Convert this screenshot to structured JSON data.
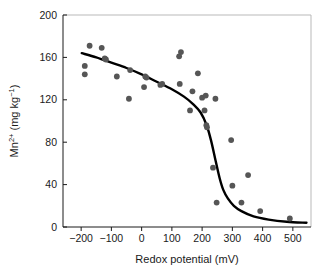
{
  "chart_data": {
    "type": "scatter",
    "title": "",
    "xlabel": "Redox potential (mV)",
    "ylabel_html": "Mn2+ (mg kg-1)",
    "ylabel_base": "Mn",
    "ylabel_sup": "2+",
    "ylabel_units_open": " (mg kg",
    "ylabel_units_sup": "−1",
    "ylabel_units_close": ")",
    "xlim": [
      -260,
      560
    ],
    "ylim": [
      0,
      200
    ],
    "xticks": [
      -200,
      -100,
      0,
      100,
      200,
      300,
      400,
      500
    ],
    "xtick_labels": [
      "−200",
      "−100",
      "0",
      "100",
      "200",
      "300",
      "400",
      "500"
    ],
    "yticks": [
      0,
      40,
      80,
      120,
      160,
      200
    ],
    "ytick_labels": [
      "0",
      "40",
      "80",
      "120",
      "160",
      "200"
    ],
    "grid": false,
    "legend": false,
    "point_color": "#565656",
    "curve_color": "#000000",
    "axis_color": "#1a1a1a",
    "points": [
      {
        "x": -188,
        "y": 152
      },
      {
        "x": -188,
        "y": 144
      },
      {
        "x": -172,
        "y": 171
      },
      {
        "x": -132,
        "y": 169
      },
      {
        "x": -122,
        "y": 159
      },
      {
        "x": -118,
        "y": 158
      },
      {
        "x": -82,
        "y": 142
      },
      {
        "x": -42,
        "y": 121
      },
      {
        "x": -38,
        "y": 148
      },
      {
        "x": 8,
        "y": 132
      },
      {
        "x": 12,
        "y": 142
      },
      {
        "x": 16,
        "y": 141
      },
      {
        "x": 62,
        "y": 134
      },
      {
        "x": 68,
        "y": 135
      },
      {
        "x": 124,
        "y": 161
      },
      {
        "x": 130,
        "y": 165
      },
      {
        "x": 126,
        "y": 135
      },
      {
        "x": 160,
        "y": 110
      },
      {
        "x": 168,
        "y": 128
      },
      {
        "x": 186,
        "y": 145
      },
      {
        "x": 200,
        "y": 122
      },
      {
        "x": 208,
        "y": 110
      },
      {
        "x": 212,
        "y": 124
      },
      {
        "x": 214,
        "y": 96
      },
      {
        "x": 216,
        "y": 94
      },
      {
        "x": 244,
        "y": 121
      },
      {
        "x": 236,
        "y": 56
      },
      {
        "x": 248,
        "y": 23
      },
      {
        "x": 296,
        "y": 82
      },
      {
        "x": 300,
        "y": 39
      },
      {
        "x": 330,
        "y": 23
      },
      {
        "x": 352,
        "y": 49
      },
      {
        "x": 392,
        "y": 15
      },
      {
        "x": 490,
        "y": 8
      }
    ],
    "curve": [
      {
        "x": -198,
        "y": 164
      },
      {
        "x": -150,
        "y": 160
      },
      {
        "x": -100,
        "y": 155
      },
      {
        "x": -50,
        "y": 150
      },
      {
        "x": 0,
        "y": 144
      },
      {
        "x": 50,
        "y": 137
      },
      {
        "x": 100,
        "y": 130
      },
      {
        "x": 140,
        "y": 123
      },
      {
        "x": 170,
        "y": 116
      },
      {
        "x": 195,
        "y": 108
      },
      {
        "x": 215,
        "y": 96
      },
      {
        "x": 230,
        "y": 81
      },
      {
        "x": 245,
        "y": 62
      },
      {
        "x": 258,
        "y": 46
      },
      {
        "x": 270,
        "y": 35
      },
      {
        "x": 285,
        "y": 27
      },
      {
        "x": 305,
        "y": 20
      },
      {
        "x": 330,
        "y": 15
      },
      {
        "x": 370,
        "y": 10
      },
      {
        "x": 420,
        "y": 7
      },
      {
        "x": 480,
        "y": 5
      },
      {
        "x": 545,
        "y": 4
      }
    ]
  },
  "geometry": {
    "plot_left": 63,
    "plot_right": 311,
    "plot_top": 15,
    "plot_bottom": 227
  }
}
